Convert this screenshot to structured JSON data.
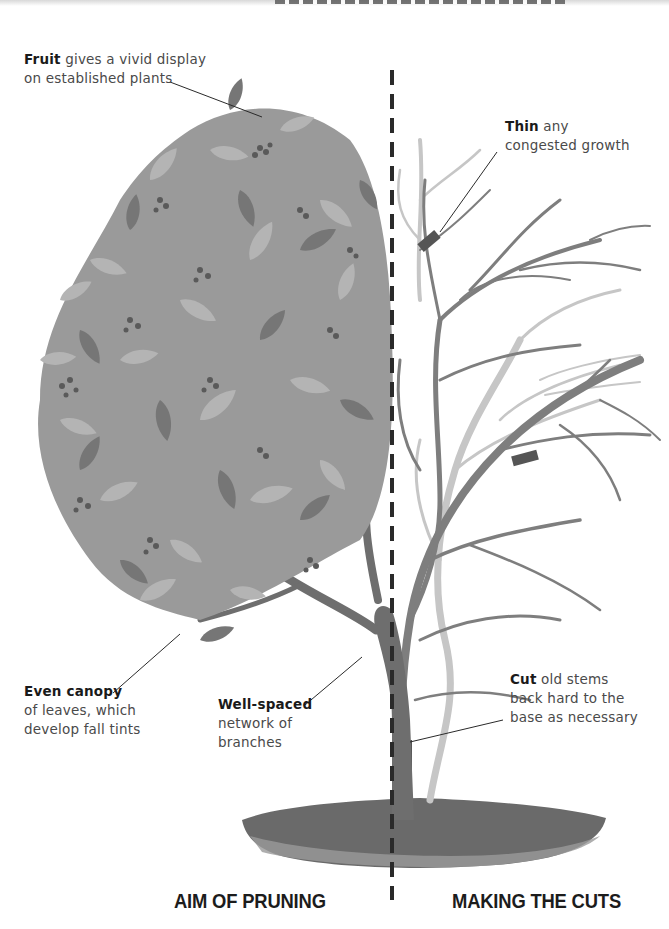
{
  "illustration": {
    "subject": "tree-pruning-diagram",
    "colors": {
      "foliage_light": "#a8a8a8",
      "foliage_mid": "#8a8a8a",
      "foliage_dark": "#6e6e6e",
      "branch": "#7a7a7a",
      "old_stem": "#c4c4c4",
      "cut_marker": "#555555",
      "soil": "#6a6a6a",
      "divider": "#2a2a2a",
      "text": "#4a4a4a",
      "heading": "#1c1c1c"
    }
  },
  "callouts": {
    "fruit": {
      "bold": "Fruit",
      "line1_rest": " gives a vivid display",
      "line2": "on established plants"
    },
    "thin": {
      "bold": "Thin",
      "line1_rest": " any",
      "line2": "congested growth"
    },
    "even_canopy": {
      "bold": "Even canopy",
      "line2": "of leaves, which",
      "line3": "develop fall tints"
    },
    "well_spaced": {
      "bold": "Well-spaced",
      "line2": "network of",
      "line3": "branches"
    },
    "cut": {
      "bold": "Cut",
      "line1_rest": " old stems",
      "line2": "back hard to the",
      "line3": "base as necessary"
    }
  },
  "sections": {
    "left_heading": "AIM OF PRUNING",
    "right_heading": "MAKING THE CUTS"
  }
}
